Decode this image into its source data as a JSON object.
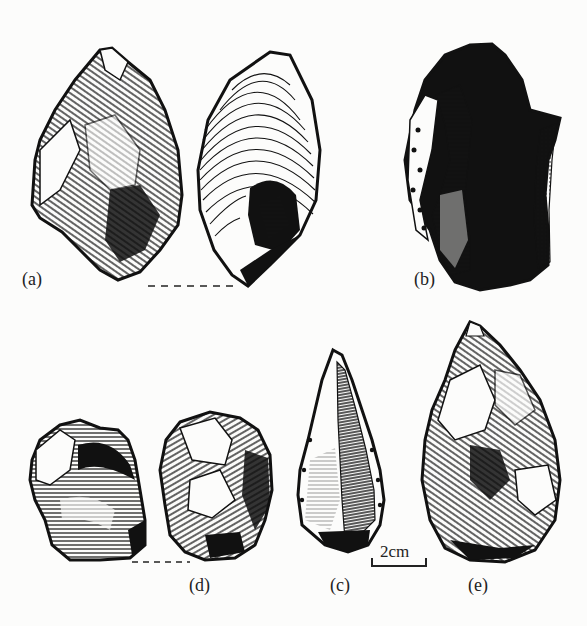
{
  "figure": {
    "labels": {
      "a": "(a)",
      "b": "(b)",
      "c": "(c)",
      "d": "(d)",
      "e": "(e)"
    },
    "scale_bar": {
      "text": "2cm"
    },
    "colors": {
      "ink": "#111111",
      "paper": "#fcfcfb"
    }
  }
}
